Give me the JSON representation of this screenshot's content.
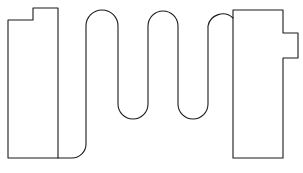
{
  "figure": {
    "type": "engineering-cross-section",
    "width": 303,
    "height": 173,
    "background_color": "#ffffff"
  },
  "style": {
    "outline_color": "#1a1a1a",
    "outline_width": 1.1,
    "hatch_color": "#555555",
    "hatch_width": 0.9,
    "hatch_angle_deg": 45,
    "hatch_spacing": 11,
    "section_fill": "#ffffff"
  },
  "parts": [
    {
      "id": "left-block",
      "name": "left-hatched-block",
      "label": "Left rigid block (sectioned)",
      "hatched": true,
      "feature": "top-left step notch",
      "path": "M 8,20 L 33,20 L 33,8 L 58,8 L 58,158 L 8,158 Z",
      "bbox": [
        8,
        8,
        50,
        150
      ]
    },
    {
      "id": "right-block",
      "name": "right-hatched-block",
      "label": "Right rigid block (sectioned)",
      "hatched": true,
      "feature": "right-side protruding tab",
      "path": "M 233,10 L 283,10 L 283,33 L 298,33 L 298,58 L 283,58 L 283,158 L 233,158 Z",
      "bbox": [
        233,
        10,
        65,
        148
      ]
    },
    {
      "id": "serpentine",
      "name": "serpentine-spring",
      "label": "Serpentine meander spring",
      "hatched": false,
      "turns": 5,
      "path": "M 58,158 L 72,158 A 14,14 0 0 0 86,144 L 86,26 A 16,16 0 0 1 118,26 L 118,104 A 15,15 0 0 0 148,104 L 148,26 A 15,15 0 0 1 178,26 L 178,104 A 15,15 0 0 0 208,104 L 208,26 A 15,15 0 0 1 233,18 L 233,18"
    }
  ],
  "geometry": {
    "serpentine_vertical_runs_x": [
      86,
      118,
      148,
      178,
      208
    ],
    "top_arch_peak_y": 10,
    "mid_trough_bottom_y": 119,
    "bottom_loop_y": 158,
    "block_top_y": 8,
    "block_bottom_y": 158
  }
}
